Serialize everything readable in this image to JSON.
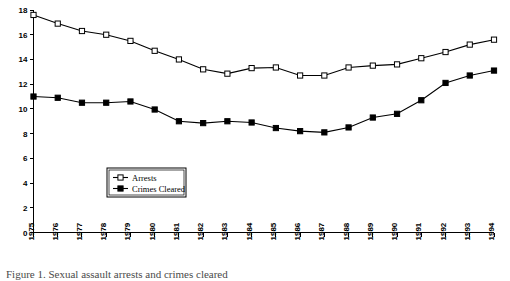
{
  "chart_data": {
    "type": "line",
    "title": "",
    "subtitle": "",
    "xlabel": "",
    "ylabel": "",
    "categories": [
      "1975",
      "1976",
      "1977",
      "1978",
      "1979",
      "1980",
      "1981",
      "1982",
      "1983",
      "1984",
      "1985",
      "1986",
      "1987",
      "1988",
      "1989",
      "1990",
      "1991",
      "1992",
      "1993",
      "1994"
    ],
    "x": [
      1975,
      1976,
      1977,
      1978,
      1979,
      1980,
      1981,
      1982,
      1983,
      1984,
      1985,
      1986,
      1987,
      1988,
      1989,
      1990,
      1991,
      1992,
      1993,
      1994
    ],
    "series": [
      {
        "name": "Arrests",
        "marker": "open-square",
        "values": [
          17.6,
          16.9,
          16.3,
          16.0,
          15.5,
          14.7,
          14.0,
          13.2,
          12.85,
          13.3,
          13.35,
          12.7,
          12.7,
          13.35,
          13.5,
          13.6,
          14.1,
          14.6,
          15.2,
          15.6
        ]
      },
      {
        "name": "Crimes Cleared",
        "marker": "filled-square",
        "values": [
          11.0,
          10.9,
          10.5,
          10.5,
          10.6,
          9.95,
          9.0,
          8.85,
          9.0,
          8.9,
          8.45,
          8.2,
          8.1,
          8.5,
          9.3,
          9.6,
          10.7,
          12.1,
          12.7,
          13.1
        ]
      }
    ],
    "ylim": [
      0,
      18
    ],
    "yticks": [
      0,
      2,
      4,
      6,
      8,
      10,
      12,
      14,
      16,
      18
    ],
    "ytick_labels": [
      "0",
      "2",
      "4",
      "6",
      "8",
      "10",
      "12",
      "14",
      "16",
      "18"
    ],
    "xlim": [
      1975,
      1994
    ],
    "grid": false,
    "legend": {
      "position": "inside-lower-left",
      "entries": [
        {
          "label": "Arrests",
          "marker": "open-square"
        },
        {
          "label": "Crimes Cleared",
          "marker": "filled-square"
        }
      ]
    }
  },
  "caption": {
    "partial_text": "Figure  1.  Sexual assault arrests and crimes cleared"
  }
}
